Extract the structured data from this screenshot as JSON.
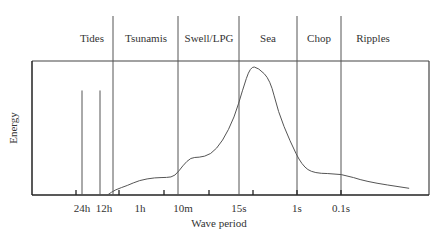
{
  "chart_data": {
    "type": "line",
    "title": "",
    "xlabel": "Wave period",
    "ylabel": "Energy",
    "x_scale": "log (decreasing period, left to right)",
    "tick_labels": [
      "24h",
      "12h",
      "1h",
      "10m",
      "15s",
      "1s",
      "0.1s"
    ],
    "bands": [
      "Tides",
      "Tsunamis",
      "Swell/LPG",
      "Sea",
      "Chop",
      "Ripples"
    ],
    "band_boundaries_at": [
      "12h",
      "10m",
      "15s",
      "1s",
      "0.1s"
    ],
    "tidal_spikes": [
      {
        "period": "24h",
        "relative_energy": 0.78
      },
      {
        "period": "12h",
        "relative_energy": 0.78
      }
    ],
    "series": [
      {
        "name": "Energy spectrum",
        "points": [
          {
            "u": 0.19,
            "e": 0.0
          },
          {
            "u": 0.21,
            "e": 0.04
          },
          {
            "u": 0.24,
            "e": 0.07
          },
          {
            "u": 0.27,
            "e": 0.11
          },
          {
            "u": 0.31,
            "e": 0.13
          },
          {
            "u": 0.34,
            "e": 0.13
          },
          {
            "u": 0.36,
            "e": 0.14
          },
          {
            "u": 0.38,
            "e": 0.22
          },
          {
            "u": 0.4,
            "e": 0.28
          },
          {
            "u": 0.42,
            "e": 0.28
          },
          {
            "u": 0.45,
            "e": 0.3
          },
          {
            "u": 0.48,
            "e": 0.4
          },
          {
            "u": 0.51,
            "e": 0.58
          },
          {
            "u": 0.53,
            "e": 0.78
          },
          {
            "u": 0.55,
            "e": 0.96
          },
          {
            "u": 0.57,
            "e": 0.95
          },
          {
            "u": 0.6,
            "e": 0.86
          },
          {
            "u": 0.62,
            "e": 0.62
          },
          {
            "u": 0.65,
            "e": 0.4
          },
          {
            "u": 0.68,
            "e": 0.22
          },
          {
            "u": 0.71,
            "e": 0.16
          },
          {
            "u": 0.78,
            "e": 0.16
          },
          {
            "u": 0.84,
            "e": 0.1
          },
          {
            "u": 0.95,
            "e": 0.05
          }
        ]
      }
    ],
    "grid": false,
    "legend": "none"
  }
}
